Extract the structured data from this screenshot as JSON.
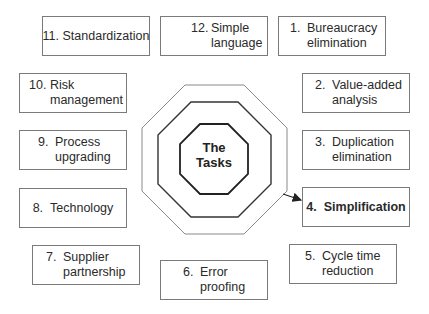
{
  "center": {
    "line1": "The",
    "line2": "Tasks"
  },
  "tasks": [
    {
      "number": "1.",
      "line1": "Bureaucracy",
      "line2": "elimination",
      "emphasis": false
    },
    {
      "number": "2.",
      "line1": "Value-added",
      "line2": "analysis",
      "emphasis": false
    },
    {
      "number": "3.",
      "line1": "Duplication",
      "line2": "elimination",
      "emphasis": false
    },
    {
      "number": "4.",
      "line1": "Simplification",
      "line2": "",
      "emphasis": true
    },
    {
      "number": "5.",
      "line1": "Cycle time",
      "line2": "reduction",
      "emphasis": false
    },
    {
      "number": "6.",
      "line1": "Error",
      "line2": "proofing",
      "emphasis": false
    },
    {
      "number": "7.",
      "line1": "Supplier",
      "line2": "partnership",
      "emphasis": false
    },
    {
      "number": "8.",
      "line1": "Technology",
      "line2": "",
      "emphasis": false
    },
    {
      "number": "9.",
      "line1": "Process",
      "line2": "upgrading",
      "emphasis": false
    },
    {
      "number": "10.",
      "line1": "Risk",
      "line2": "management",
      "emphasis": false
    },
    {
      "number": "11.",
      "line1": "Standardization",
      "line2": "",
      "emphasis": false
    },
    {
      "number": "12.",
      "line1": "Simple",
      "line2": "language",
      "emphasis": false
    }
  ],
  "colors": {
    "box_border": "#7a7a7a",
    "outer_octagon": "#8a8a8a",
    "middle_octagon": "#333333",
    "inner_octagon": "#222222",
    "text": "#2a2a2a"
  }
}
